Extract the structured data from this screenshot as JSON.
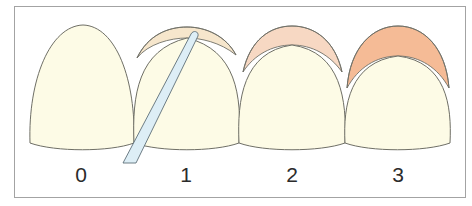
{
  "diagram": {
    "type": "dental-grading-illustration",
    "colors": {
      "tooth_fill": "#fdfbe6",
      "outline": "#6f6f66",
      "frame_border": "#a3a3a3",
      "grade1_overlay": "#f6e6cc",
      "grade2_overlay": "#f7d8c3",
      "grade3_overlay": "#f5bb96",
      "probe_fill": "#ddeef6",
      "probe_outline": "#5f6f78",
      "label_color": "#2b2b2b"
    },
    "grades": [
      {
        "label": "0",
        "has_overlay": false,
        "has_probe": false
      },
      {
        "label": "1",
        "has_overlay": true,
        "has_probe": true
      },
      {
        "label": "2",
        "has_overlay": true,
        "has_probe": false
      },
      {
        "label": "3",
        "has_overlay": true,
        "has_probe": false
      }
    ]
  }
}
